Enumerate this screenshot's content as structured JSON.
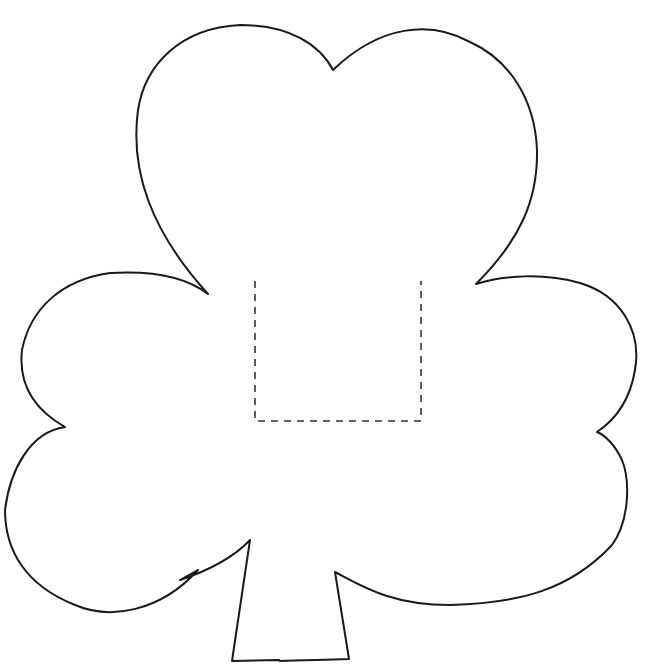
{
  "figure": {
    "leaves": 3,
    "has_stem": true,
    "cut_guide": {
      "style": "dashed",
      "shape": "open-top-rectangle",
      "x1": 255,
      "y1": 281,
      "x2": 421,
      "y2": 421
    },
    "colors": {
      "background": "#ffffff",
      "outline": "#1a1a1a",
      "dashed_line": "#333333"
    }
  }
}
